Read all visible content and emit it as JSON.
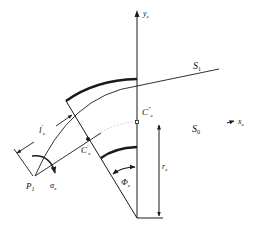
{
  "diagram": {
    "type": "geometric-figure",
    "labels": {
      "y_axis": "y",
      "y_axis_sub": "e",
      "x_axis": "x",
      "x_axis_sub": "e",
      "surface_1": "S",
      "surface_1_sub": "1",
      "surface_0": "S",
      "surface_0_sub": "0",
      "center_upper": "C",
      "center_upper_sup": "″",
      "center_upper_sub": "e",
      "center_lower": "C",
      "center_lower_sup": "′",
      "center_lower_sub": "e",
      "length": "l",
      "length_sup": "′",
      "length_sub": "e",
      "point": "P",
      "point_sub": "1",
      "angle_alpha": "α",
      "angle_alpha_sub": "e",
      "angle_phi": "Φ",
      "angle_phi_sub": "e",
      "radius": "r",
      "radius_sub": "e"
    },
    "colors": {
      "stroke": "#1a1a1a",
      "faint": "#bbbbbb",
      "background": "#ffffff"
    }
  }
}
